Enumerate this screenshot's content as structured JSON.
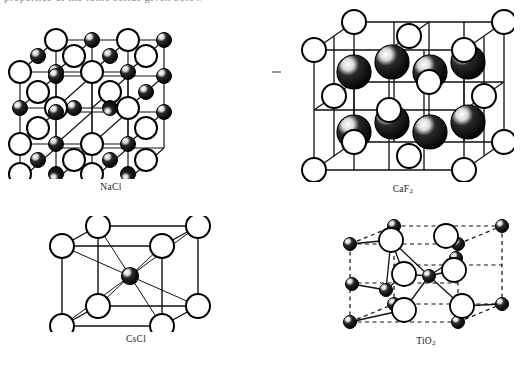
{
  "page": {
    "background": "#ffffff",
    "cropped_top_text": "properties of the ionic solids given below",
    "ink_color": "#1a1a1a"
  },
  "artifacts": {
    "stray_dash": "-"
  },
  "figures": [
    {
      "id": "nacl",
      "label": "NaCl",
      "label_base": "NaCl",
      "label_sub": "",
      "structure": "rock-salt",
      "grid": 3,
      "cell_lines": "solid",
      "atoms": {
        "large_open": {
          "name": "chloride-ion",
          "fill": "#ffffff",
          "stroke": "#000000"
        },
        "small_filled": {
          "name": "sodium-ion",
          "fill": "#000000",
          "stroke": "#000000"
        }
      }
    },
    {
      "id": "caf2",
      "label": "CaF2",
      "label_base": "CaF",
      "label_sub": "2",
      "structure": "fluorite",
      "cell_lines": "solid",
      "atoms": {
        "large_open": {
          "name": "calcium-ion",
          "fill": "#ffffff",
          "stroke": "#000000"
        },
        "large_filled": {
          "name": "fluoride-ion",
          "fill": "#000000",
          "stroke": "#000000"
        }
      },
      "filled_count": 8
    },
    {
      "id": "cscl",
      "label": "CsCl",
      "label_base": "CsCl",
      "label_sub": "",
      "structure": "caesium-chloride",
      "cell_lines": "solid",
      "atoms": {
        "large_open": {
          "name": "chloride-ion",
          "fill": "#ffffff",
          "stroke": "#000000"
        },
        "small_filled": {
          "name": "caesium-ion",
          "fill": "#000000",
          "stroke": "#000000"
        }
      },
      "corner_count": 8,
      "body_centre_count": 1
    },
    {
      "id": "tio2",
      "label": "TiO2",
      "label_base": "TiO",
      "label_sub": "2",
      "structure": "rutile",
      "cell_lines": "dashed",
      "atoms": {
        "small_filled": {
          "name": "titanium-ion",
          "fill": "#000000",
          "stroke": "#000000"
        },
        "large_open": {
          "name": "oxide-ion",
          "fill": "#ffffff",
          "stroke": "#000000"
        }
      }
    }
  ]
}
